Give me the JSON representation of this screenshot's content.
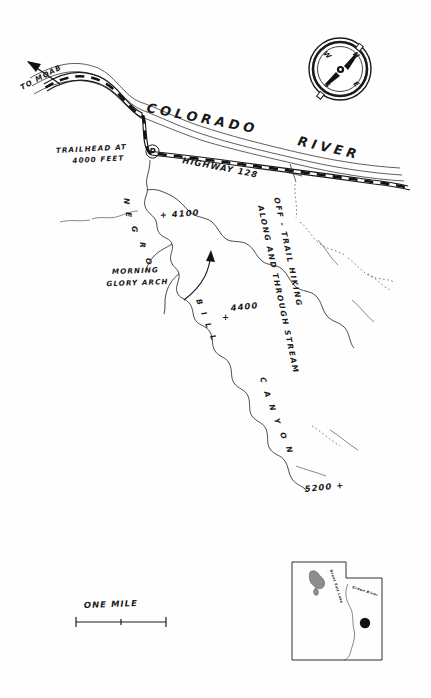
{
  "map": {
    "title": "Negro Bill Canyon Trail Map",
    "labels": {
      "to_moab": "TO MOAB",
      "colorado_river": "COLORADO",
      "colorado_river_2": "RIVER",
      "trailhead_line1": "TRAILHEAD AT",
      "trailhead_line2": "4000 FEET",
      "parking_symbol": "P",
      "highway": "HIGHWAY  128",
      "morning_glory_line1": "MORNING",
      "morning_glory_line2": "GLORY ARCH",
      "canyon_name_vertical": "NEGRO",
      "canyon_name_diagonal_1": "BILL",
      "canyon_name_diagonal_2": "CANYON",
      "note_line_1": "OFF - TRAIL  HIKING",
      "note_line_2": "ALONG AND THROUGH STREAM",
      "scale_label": "ONE MILE"
    },
    "elevations": [
      {
        "id": "elev-4000",
        "value": "4000 FEET"
      },
      {
        "id": "elev-4100",
        "value": "+ 4100",
        "mark": "+",
        "number": "4100"
      },
      {
        "id": "elev-4400",
        "value": "4400",
        "mark": "+",
        "number": "4400"
      },
      {
        "id": "elev-5200",
        "value": "5200 +",
        "mark": "+",
        "number": "5200"
      }
    ],
    "canyon_letters_vertical": [
      "N",
      "E",
      "G",
      "R",
      "O"
    ],
    "canyon_letters_bill": [
      "B",
      "I",
      "L",
      "L"
    ],
    "canyon_letters_canyon": [
      "C",
      "A",
      "N",
      "Y",
      "O",
      "N"
    ],
    "note_letters_1": [
      "O",
      "F",
      "F",
      "-",
      "T",
      "R",
      "A",
      "I",
      "L",
      "H",
      "I",
      "K",
      "I",
      "N",
      "G"
    ],
    "note_letters_2": [
      "A",
      "L",
      "O",
      "N",
      "G",
      "A",
      "N",
      "D",
      "T",
      "H",
      "R",
      "O",
      "U",
      "G",
      "H",
      "S",
      "T",
      "R",
      "E",
      "A",
      "M"
    ],
    "compass": {
      "north": "N",
      "east": "E",
      "south": "S",
      "west": "W",
      "needle_direction": "northeast"
    },
    "inset": {
      "state": "UTAH",
      "lake_label": "Great Salt Lake",
      "river_label": "Green River",
      "site_marker": "location-dot"
    },
    "colors": {
      "ink": "#1a1a1a",
      "paper": "#fefefe",
      "hairline": "#3a3a3a"
    }
  }
}
